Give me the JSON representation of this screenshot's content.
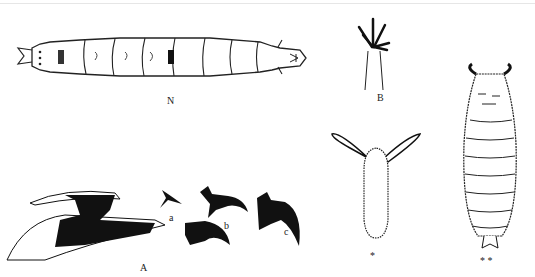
{
  "figure": {
    "type": "scientific-illustration",
    "subjects": [
      {
        "id": "larva",
        "label": "N",
        "description": "segmented larva, dorsal view"
      },
      {
        "id": "spiracle",
        "label": "B",
        "description": "posterior spiracle with branched processes"
      },
      {
        "id": "cephalopharyngeal",
        "label": "A",
        "description": "cephalopharyngeal skeleton with mouth hooks"
      },
      {
        "id": "hook_a",
        "label": "a",
        "description": "mouth hook variant a"
      },
      {
        "id": "hook_b",
        "label": "b",
        "description": "mouth hook variant b"
      },
      {
        "id": "hook_c",
        "label": "c",
        "description": "mouth hook variant c"
      },
      {
        "id": "egg",
        "label": "*",
        "description": "egg with respiratory filaments"
      },
      {
        "id": "puparium",
        "label": "**",
        "description": "puparium"
      }
    ]
  },
  "labels": {
    "N": "N",
    "B": "B",
    "A": "A",
    "a": "a",
    "b": "b",
    "c": "c",
    "egg": "*",
    "puparium": "* *"
  }
}
